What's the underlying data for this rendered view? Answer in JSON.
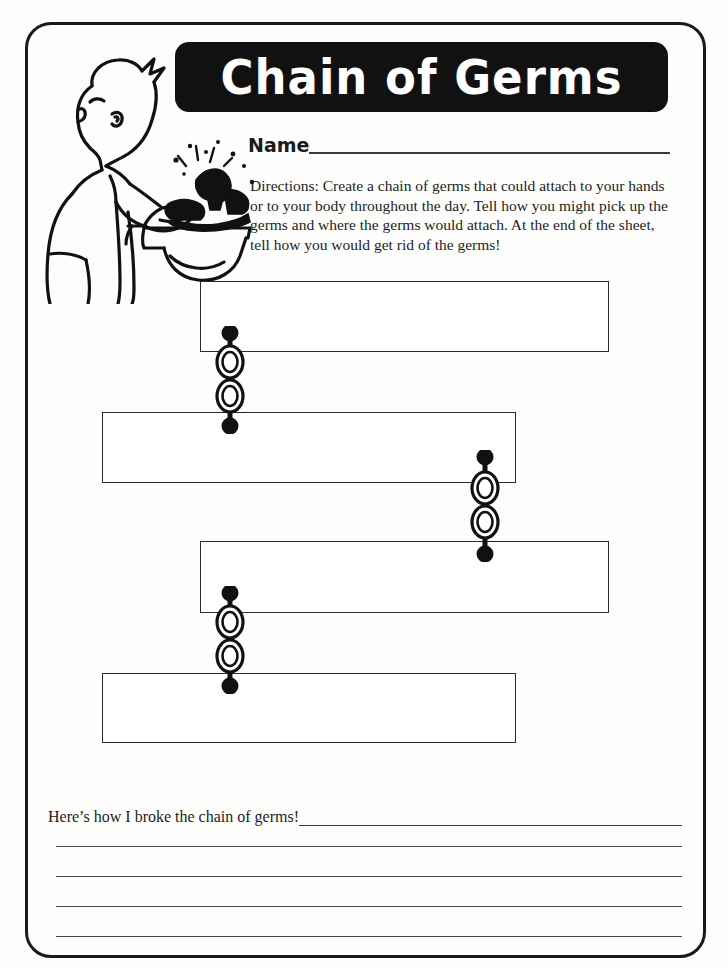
{
  "worksheet": {
    "title": "Chain of Germs",
    "name_label": "Name",
    "directions": "Directions: Create a chain of germs that could attach to your hands or to your body throughout the day. Tell how you might pick up the germs and where the germs would attach. At the end of the sheet, tell how you would get rid of the germs!",
    "illustration_alt": "boy-washing-hands-at-sink"
  },
  "chain": {
    "boxes": [
      {
        "id": "box-1",
        "value": ""
      },
      {
        "id": "box-2",
        "value": ""
      },
      {
        "id": "box-3",
        "value": ""
      },
      {
        "id": "box-4",
        "value": ""
      }
    ],
    "connectors": [
      {
        "id": "chain-1",
        "links": 2
      },
      {
        "id": "chain-2",
        "links": 2
      },
      {
        "id": "chain-3",
        "links": 2
      }
    ]
  },
  "bottom": {
    "prompt": "Here’s how I broke the chain of germs!",
    "blank_lines": 4
  },
  "colors": {
    "ink": "#1a1a1a",
    "banner_bg": "#111111",
    "banner_text": "#ffffff",
    "rule": "#3a3a3a",
    "paper": "#fdfdfc"
  }
}
